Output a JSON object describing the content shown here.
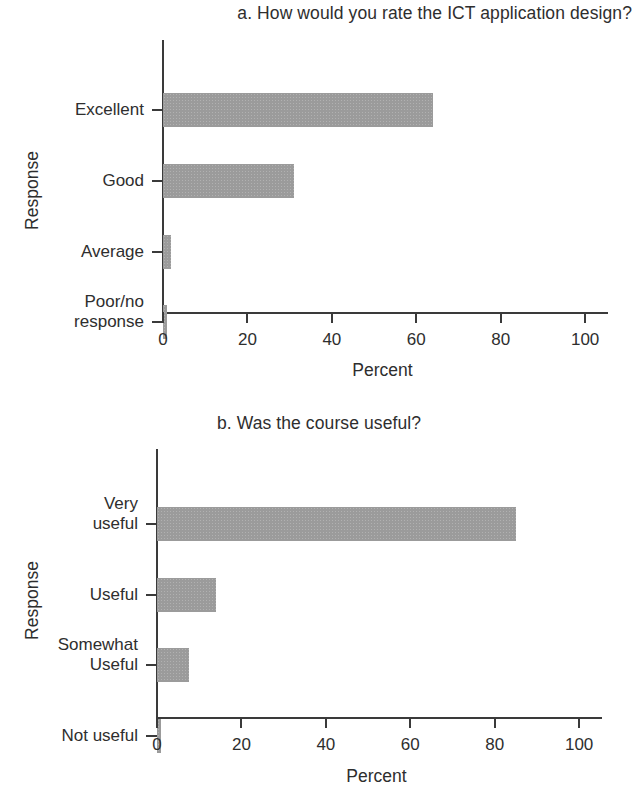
{
  "figure": {
    "background_color": "#ffffff",
    "bar_color": "#9b9b9b",
    "axis_color": "#3a3a3a",
    "text_color": "#2e2e2e"
  },
  "chart_data": [
    {
      "id": "chart-a",
      "type": "bar",
      "orientation": "horizontal",
      "title": "a. How would you rate the ICT application design?",
      "xlabel": "Percent",
      "ylabel": "Response",
      "categories": [
        "Excellent",
        "Good",
        "Average",
        "Poor/no response"
      ],
      "values": [
        64,
        31,
        2,
        1
      ],
      "xlim": [
        0,
        104
      ],
      "xticks": [
        0,
        20,
        40,
        60,
        80,
        100
      ],
      "xticklabels": [
        "0",
        "20",
        "40",
        "60",
        "80",
        "100"
      ],
      "grid": false,
      "legend": "none"
    },
    {
      "id": "chart-b",
      "type": "bar",
      "orientation": "horizontal",
      "title": "b. Was the course useful?",
      "xlabel": "Percent",
      "ylabel": "Response",
      "categories": [
        "Very useful",
        "Useful",
        "Somewhat Useful",
        "Not useful"
      ],
      "values": [
        85,
        14,
        7.5,
        1
      ],
      "xlim": [
        0,
        104
      ],
      "xticks": [
        0,
        20,
        40,
        60,
        80,
        100
      ],
      "xticklabels": [
        "0",
        "20",
        "40",
        "60",
        "80",
        "100"
      ],
      "grid": false,
      "legend": "none"
    }
  ]
}
